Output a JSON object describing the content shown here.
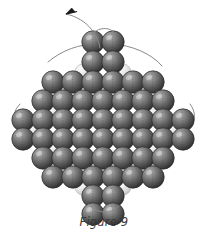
{
  "figure": {
    "caption": "Figure 9",
    "background_color": "#ffffff",
    "thread_color": "#8a8a8a",
    "arrow_color": "#1a1a1a",
    "bead_dark_color": "#565656",
    "bead_dark_edge_color": "#2b2b2b",
    "bead_pale_color": "#dcdcdc",
    "bead_pale_edge_color": "#b4b4b4",
    "bead_radius": 11.2,
    "pale_bead_radius": 8.0,
    "arrow": {
      "label": "thread-direction-arrow",
      "tip_x": 66,
      "tip_y": 14,
      "angle_deg": -28
    },
    "thread_path": "M 66 14 C 76 16, 86 22, 92 30 C 97 37, 99 42, 100 48",
    "outline_arcs": [
      "M 48 62 C 62 50, 80 44, 96 44",
      "M 112 44 C 132 45, 152 54, 162 66",
      "M 166 150 C 156 166, 140 178, 124 184",
      "M 86 186 C 68 180, 54 168, 44 152",
      "M 20 104 C 14 110, 12 118, 16 126",
      "M 190 104 C 196 112, 196 120, 190 128"
    ],
    "loops": [
      "M 92 34 C 100 26, 112 27, 116 35",
      "M 90 206 C 98 214, 112 214, 119 206"
    ],
    "bead_rows": [
      {
        "name": "row-top-1",
        "y": 42,
        "x_start": 93,
        "count": 2,
        "spacing": 20,
        "type": "dark"
      },
      {
        "name": "row-top-2",
        "y": 62,
        "x_start": 93,
        "count": 2,
        "spacing": 20,
        "type": "dark"
      },
      {
        "name": "row-3",
        "y": 82,
        "x_start": 53,
        "count": 6,
        "spacing": 20,
        "type": "dark"
      },
      {
        "name": "row-4",
        "y": 101,
        "x_start": 43,
        "count": 7,
        "spacing": 20,
        "type": "dark"
      },
      {
        "name": "row-5",
        "y": 120,
        "x_start": 23,
        "count": 9,
        "spacing": 20,
        "type": "dark"
      },
      {
        "name": "row-6",
        "y": 139,
        "x_start": 23,
        "count": 9,
        "spacing": 20,
        "type": "dark"
      },
      {
        "name": "row-7",
        "y": 158,
        "x_start": 43,
        "count": 7,
        "spacing": 20,
        "type": "dark"
      },
      {
        "name": "row-8",
        "y": 177,
        "x_start": 53,
        "count": 6,
        "spacing": 20,
        "type": "dark"
      },
      {
        "name": "row-bottom-1",
        "y": 196,
        "x_start": 93,
        "count": 2,
        "spacing": 20,
        "type": "dark"
      },
      {
        "name": "row-bottom-2",
        "y": 214,
        "x_start": 93,
        "count": 2,
        "spacing": 20,
        "type": "dark"
      }
    ],
    "pale_beads": [
      {
        "x": 83,
        "y": 72
      },
      {
        "x": 123,
        "y": 72
      },
      {
        "x": 63,
        "y": 92
      },
      {
        "x": 143,
        "y": 92
      },
      {
        "x": 53,
        "y": 111
      },
      {
        "x": 153,
        "y": 111
      },
      {
        "x": 33,
        "y": 130
      },
      {
        "x": 173,
        "y": 130
      },
      {
        "x": 53,
        "y": 149
      },
      {
        "x": 153,
        "y": 149
      },
      {
        "x": 63,
        "y": 168
      },
      {
        "x": 143,
        "y": 168
      },
      {
        "x": 83,
        "y": 187
      },
      {
        "x": 123,
        "y": 187
      },
      {
        "x": 103,
        "y": 92
      },
      {
        "x": 103,
        "y": 168
      }
    ]
  }
}
